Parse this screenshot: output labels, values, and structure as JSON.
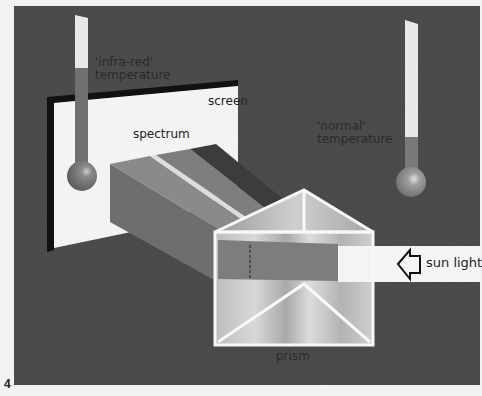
{
  "figure": {
    "number": "4",
    "colors": {
      "background_panel": "#474747",
      "page": "#f2f2f2",
      "screen": "#f4f4f4",
      "screen_border": "#111111",
      "thermometer_tube": "#e6e6e6",
      "thermometer_fluid": "#6e6e6e",
      "prism_edge": "#f8f8f8",
      "beam": "#f6f6f6"
    },
    "labels": {
      "infra_red_temperature_line1": "'infra-red'",
      "infra_red_temperature_line2": "temperature",
      "screen": "screen",
      "spectrum": "spectrum",
      "normal_temperature_line1": "'normal'",
      "normal_temperature_line2": "temperature",
      "sun_light": "sun light",
      "prism": "prism"
    },
    "elements": [
      {
        "name": "screen",
        "type": "white screen with black border"
      },
      {
        "name": "infra-red thermometer",
        "fluid_level": "high"
      },
      {
        "name": "normal thermometer",
        "fluid_level": "low"
      },
      {
        "name": "spectrum",
        "bands": 5
      },
      {
        "name": "prism",
        "shape": "triangular"
      },
      {
        "name": "sun light beam",
        "direction": "right-to-left"
      }
    ]
  }
}
